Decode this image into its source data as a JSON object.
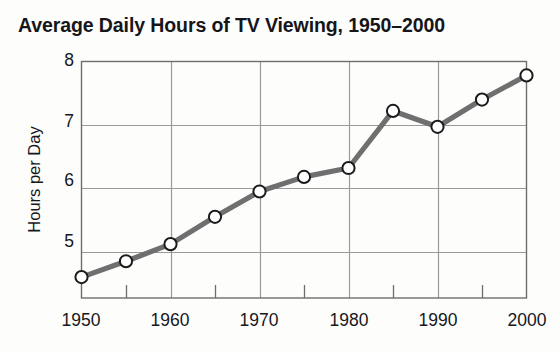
{
  "chart_data": {
    "type": "line",
    "title": "Average Daily Hours of TV Viewing, 1950–2000",
    "xlabel": "",
    "ylabel": "Hours per Day",
    "x": [
      1950,
      1955,
      1960,
      1965,
      1970,
      1975,
      1980,
      1985,
      1990,
      1995,
      2000
    ],
    "values": [
      4.6,
      4.85,
      5.12,
      5.55,
      5.95,
      6.18,
      6.32,
      7.22,
      6.97,
      7.4,
      7.78
    ],
    "xlim": [
      1950,
      2000
    ],
    "ylim": [
      4.27,
      8
    ],
    "x_tick_labels": [
      "1950",
      "1960",
      "1970",
      "1980",
      "1990",
      "2000"
    ],
    "x_tick_values": [
      1950,
      1960,
      1970,
      1980,
      1990,
      2000
    ],
    "x_minor_tick_values": [
      1955,
      1965,
      1975,
      1985,
      1995
    ],
    "y_tick_labels": [
      "8",
      "7",
      "6",
      "5"
    ],
    "y_tick_values": [
      8,
      7,
      6,
      5
    ],
    "grid": true,
    "legend": null,
    "series_name": "Average Daily Hours of TV Viewing",
    "line_color": "#6f6f6f",
    "marker_face_color": "#ffffff",
    "marker_edge_color": "#1b1b1b",
    "grid_color": "#9a9a9a",
    "axis_color": "#6e6e6e",
    "text_color": "#17171b",
    "background_color": "#fdfdfc"
  }
}
